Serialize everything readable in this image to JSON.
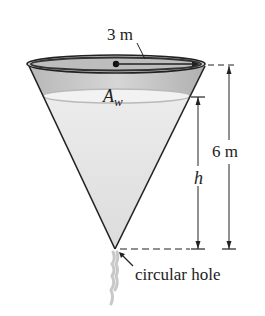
{
  "diagram": {
    "type": "conical-tank",
    "labels": {
      "radius": "3 m",
      "surface_area_main": "A",
      "surface_area_sub": "w",
      "height_total": "6 m",
      "height_water": "h",
      "hole": "circular hole"
    },
    "colors": {
      "outline": "#222222",
      "tank_gray": "#bdbdbd",
      "water": "#e4e4e4",
      "rim_inner": "#a9a9a9"
    }
  }
}
